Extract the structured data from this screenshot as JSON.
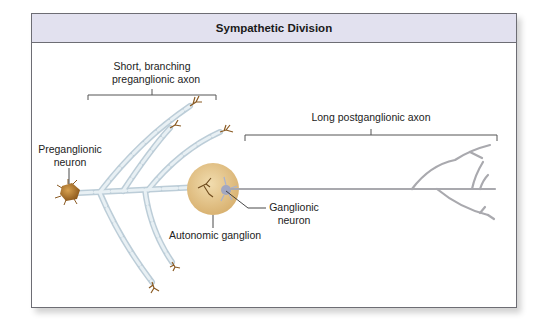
{
  "figure": {
    "title": "Sympathetic Division",
    "labels": {
      "preganglionic_axon_line1": "Short, branching",
      "preganglionic_axon_line2": "preganglionic axon",
      "preganglionic_neuron_line1": "Preganglionic",
      "preganglionic_neuron_line2": "neuron",
      "autonomic_ganglion": "Autonomic ganglion",
      "ganglionic_neuron_line1": "Ganglionic",
      "ganglionic_neuron_line2": "neuron",
      "postganglionic_axon": "Long postganglionic axon"
    },
    "colors": {
      "header_bg": "#e2e1ef",
      "frame_border": "#6d6d74",
      "myelin": "#d7e3ea",
      "neuron_body": "#b07a2e",
      "ganglion": "#e4c68c",
      "postganglionic_axon": "#a9a9ae",
      "ganglionic_neuron": "#9aa3c6"
    }
  }
}
